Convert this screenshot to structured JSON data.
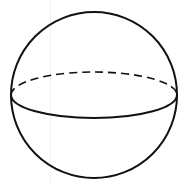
{
  "diagram": {
    "stroke_color": "#111111",
    "background": "#ffffff",
    "outline": {
      "cx": 94,
      "cy": 95,
      "r": 83
    },
    "equator": {
      "back_arc_style": "dashed",
      "front_arc_style": "solid",
      "rx": 83,
      "ry": 23
    }
  }
}
